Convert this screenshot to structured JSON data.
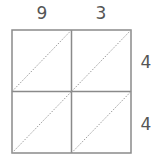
{
  "diagram": {
    "type": "lattice-multiplication-grid",
    "top_digits": [
      "9",
      "3"
    ],
    "side_digits": [
      "4",
      "4"
    ],
    "rows": 2,
    "cols": 2,
    "line_color": "#8a8a8a",
    "text_color": "#555555"
  }
}
